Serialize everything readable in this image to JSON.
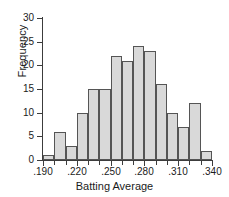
{
  "chart_data": {
    "type": "bar",
    "title": "",
    "xlabel": "Batting Average",
    "ylabel": "Frequency",
    "bin_width": 0.01,
    "bin_start": 0.19,
    "categories": [
      "0.190-0.200",
      "0.200-0.210",
      "0.210-0.220",
      "0.220-0.230",
      "0.230-0.240",
      "0.240-0.250",
      "0.250-0.260",
      "0.260-0.270",
      "0.270-0.280",
      "0.280-0.290",
      "0.290-0.300",
      "0.300-0.310",
      "0.310-0.320",
      "0.320-0.330",
      "0.330-0.340"
    ],
    "values": [
      1,
      6,
      3,
      10,
      15,
      15,
      22,
      21,
      24,
      23,
      16,
      10,
      7,
      12,
      2
    ],
    "xlim": [
      0.19,
      0.34
    ],
    "ylim": [
      0,
      30
    ],
    "ytick_values": [
      0,
      5,
      10,
      15,
      20,
      25,
      30
    ],
    "ytick_labels": [
      "0",
      "5",
      "10",
      "15",
      "20",
      "25",
      "30"
    ],
    "xtick_values": [
      0.19,
      0.22,
      0.25,
      0.28,
      0.31,
      0.34
    ],
    "xtick_labels": [
      ".190",
      ".220",
      ".250",
      ".280",
      ".310",
      ".340"
    ],
    "xminor_values": [
      0.2,
      0.21,
      0.23,
      0.24,
      0.26,
      0.27,
      0.29,
      0.3,
      0.32,
      0.33
    ],
    "grid": false,
    "legend": null,
    "bar_fill": "#d9d9d9",
    "bar_edge": "#555555",
    "axis_color": "#3c3c3c",
    "text_color": "#1b1b1b",
    "background": "#ffffff"
  }
}
